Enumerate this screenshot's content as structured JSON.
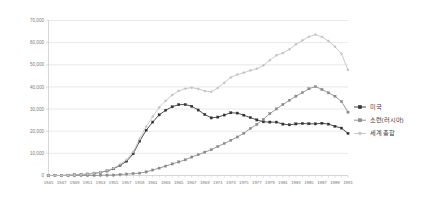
{
  "chart_data": {
    "type": "line",
    "title": "",
    "subtitle": "",
    "xlabel": "",
    "ylabel": "",
    "ylim": [
      0,
      70000
    ],
    "xlim": [
      1945,
      1991
    ],
    "grid": true,
    "legend_position": "right",
    "ytick_labels": [
      "70,000",
      "60,000",
      "50,000",
      "40,000",
      "30,000",
      "20,000",
      "10,000",
      "0"
    ],
    "ytick_values": [
      70000,
      60000,
      50000,
      40000,
      30000,
      20000,
      10000,
      0
    ],
    "x": [
      1945,
      1946,
      1947,
      1948,
      1949,
      1950,
      1951,
      1952,
      1953,
      1954,
      1955,
      1956,
      1957,
      1958,
      1959,
      1960,
      1961,
      1962,
      1963,
      1964,
      1965,
      1966,
      1967,
      1968,
      1969,
      1970,
      1971,
      1972,
      1973,
      1974,
      1975,
      1976,
      1977,
      1978,
      1979,
      1980,
      1981,
      1982,
      1983,
      1984,
      1985,
      1986,
      1987,
      1988,
      1989,
      1990,
      1991
    ],
    "xtick_labels": [
      "1945",
      "1947",
      "1949",
      "1951",
      "1953",
      "1955",
      "1957",
      "1959",
      "1961",
      "1963",
      "1965",
      "1967",
      "1969",
      "1971",
      "1973",
      "1975",
      "1977",
      "1979",
      "1981",
      "1983",
      "1985",
      "1987",
      "1989",
      "1991"
    ],
    "series": [
      {
        "name": "미국",
        "color": "#333333",
        "marker": "square",
        "values": [
          6,
          11,
          32,
          110,
          235,
          369,
          640,
          1005,
          1436,
          2063,
          3057,
          4618,
          6444,
          9822,
          15468,
          20434,
          24111,
          27387,
          29459,
          31056,
          31982,
          32040,
          31255,
          29561,
          27552,
          26008,
          26365,
          27296,
          28335,
          28170,
          27235,
          26156,
          25099,
          24243,
          24107,
          24104,
          23208,
          22886,
          23305,
          23459,
          23368,
          23317,
          23575,
          23205,
          22217,
          21392,
          19008
        ]
      },
      {
        "name": "소련(러시아)",
        "color": "#8a8a8a",
        "marker": "square",
        "values": [
          0,
          0,
          0,
          0,
          1,
          5,
          25,
          50,
          120,
          150,
          200,
          426,
          660,
          869,
          1060,
          1605,
          2471,
          3322,
          4238,
          5221,
          6129,
          7089,
          8339,
          9399,
          10538,
          11643,
          13092,
          14478,
          15915,
          17385,
          19055,
          21205,
          23044,
          25393,
          27935,
          30062,
          32049,
          33952,
          35804,
          37431,
          39197,
          40159,
          38859,
          37333,
          35805,
          33417,
          28595
        ]
      },
      {
        "name": "세계 총합",
        "color": "#c2c2c2",
        "marker": "diamond",
        "values": [
          6,
          11,
          32,
          110,
          236,
          374,
          665,
          1057,
          1560,
          2219,
          3262,
          5050,
          7111,
          10700,
          16533,
          22050,
          26598,
          30736,
          33719,
          36314,
          38188,
          39232,
          39691,
          39077,
          38168,
          37798,
          39554,
          41866,
          44301,
          45600,
          46415,
          47441,
          48218,
          49732,
          52088,
          54268,
          55314,
          56968,
          59231,
          60993,
          62672,
          63632,
          62594,
          60702,
          58197,
          54939,
          47715
        ]
      }
    ]
  },
  "legend": {
    "entries": [
      {
        "label": "미국"
      },
      {
        "label": "소련(러시아)"
      },
      {
        "label": "세계 총합"
      }
    ]
  }
}
